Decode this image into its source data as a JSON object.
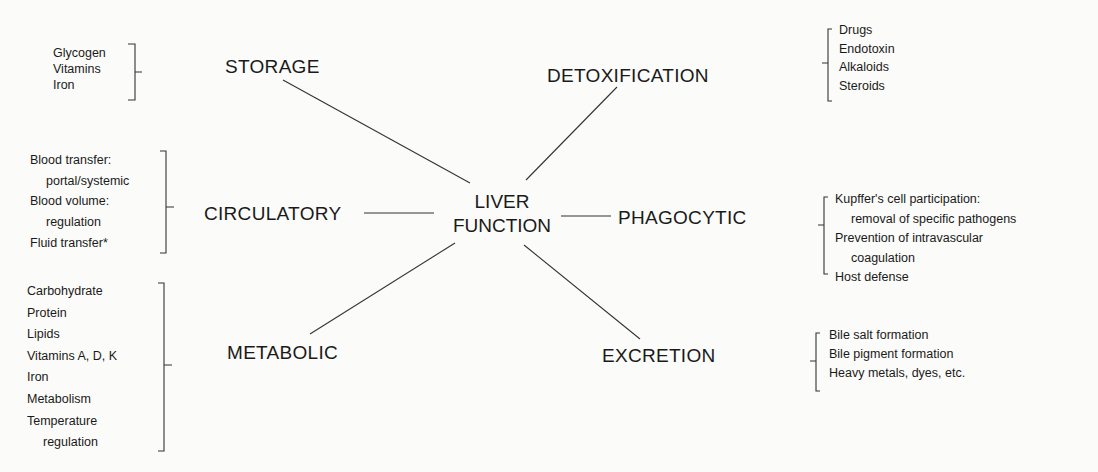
{
  "center": {
    "line1": "LIVER",
    "line2": "FUNCTION"
  },
  "nodes": {
    "storage": {
      "label": "STORAGE",
      "items": [
        "Glycogen",
        "Vitamins",
        "Iron"
      ]
    },
    "circulatory": {
      "label": "CIRCULATORY",
      "items": [
        "Blood transfer:",
        "portal/systemic",
        "Blood volume:",
        "regulation",
        "Fluid transfer*"
      ]
    },
    "metabolic": {
      "label": "METABOLIC",
      "items": [
        "Carbohydrate",
        "Protein",
        "Lipids",
        "Vitamins A, D, K",
        "Iron",
        "Metabolism",
        "Temperature",
        "regulation"
      ]
    },
    "detoxification": {
      "label": "DETOXIFICATION",
      "items": [
        "Drugs",
        "Endotoxin",
        "Alkaloids",
        "Steroids"
      ]
    },
    "phagocytic": {
      "label": "PHAGOCYTIC",
      "items": [
        "Kupffer's cell participation:",
        "removal of specific pathogens",
        "Prevention of intravascular",
        "coagulation",
        "Host defense"
      ]
    },
    "excretion": {
      "label": "EXCRETION",
      "items": [
        "Bile salt formation",
        "Bile pigment formation",
        "Heavy metals, dyes, etc."
      ]
    }
  },
  "colors": {
    "ink": "#1a1a1a",
    "paper": "#fbfbf9"
  }
}
